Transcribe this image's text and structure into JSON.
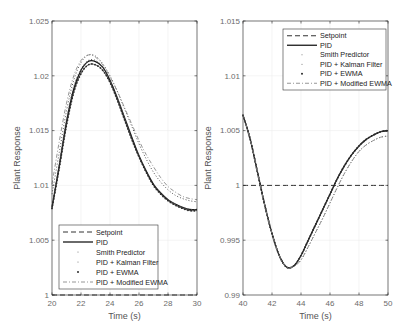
{
  "figure": {
    "background": "#ffffff",
    "axis_color": "#262626",
    "tick_label_color": "#6b6b6b",
    "grid_color": "#ececec"
  },
  "chart_data": [
    {
      "type": "line",
      "title": "",
      "xlabel": "Time (s)",
      "ylabel": "Plant Response",
      "xlim": [
        20,
        30
      ],
      "ylim": [
        1,
        1.025
      ],
      "xticks": [
        20,
        22,
        24,
        26,
        28,
        30
      ],
      "xtick_labels": [
        "20",
        "22",
        "24",
        "26",
        "28",
        "30"
      ],
      "yticks": [
        1,
        1.005,
        1.01,
        1.015,
        1.02,
        1.025
      ],
      "ytick_labels": [
        "1",
        "1.005",
        "1.01",
        "1.015",
        "1.02",
        "1.025"
      ],
      "grid": true,
      "legend_position": "lower left",
      "legend": [
        "Setpoint",
        "PID",
        "Smith Predictor",
        "PID + Kalman Filter",
        "PID + EWMA",
        "PID + Modified EWMA"
      ],
      "x": [
        20,
        20.5,
        21,
        21.5,
        22,
        22.5,
        23,
        23.5,
        24,
        24.5,
        25,
        25.5,
        26,
        26.5,
        27,
        27.5,
        28,
        28.5,
        29,
        29.5,
        30
      ],
      "series": [
        {
          "name": "Setpoint",
          "style": "dashed",
          "values": [
            1,
            1,
            1,
            1,
            1,
            1,
            1,
            1,
            1,
            1,
            1,
            1,
            1,
            1,
            1,
            1,
            1,
            1,
            1,
            1,
            1
          ]
        },
        {
          "name": "PID",
          "style": "solid",
          "values": [
            1.008,
            1.0118,
            1.0158,
            1.0188,
            1.0205,
            1.0213,
            1.0213,
            1.0208,
            1.0196,
            1.018,
            1.0162,
            1.0144,
            1.0127,
            1.0113,
            1.0101,
            1.0093,
            1.0087,
            1.0083,
            1.008,
            1.0078,
            1.0078
          ]
        },
        {
          "name": "Smith Predictor",
          "style": "dotted",
          "values": [
            1.008,
            1.012,
            1.016,
            1.019,
            1.0206,
            1.0214,
            1.0214,
            1.0208,
            1.0196,
            1.018,
            1.0162,
            1.0144,
            1.0127,
            1.0113,
            1.0101,
            1.0093,
            1.0087,
            1.0083,
            1.008,
            1.0078,
            1.0078
          ]
        },
        {
          "name": "PID + Kalman Filter",
          "style": "dotted",
          "values": [
            1.0092,
            1.013,
            1.0168,
            1.0196,
            1.0212,
            1.0219,
            1.0218,
            1.0211,
            1.02,
            1.0186,
            1.017,
            1.0154,
            1.0138,
            1.0124,
            1.0112,
            1.0103,
            1.0096,
            1.0091,
            1.0088,
            1.0086,
            1.0085
          ]
        },
        {
          "name": "PID + EWMA",
          "style": "marker",
          "values": [
            1.0079,
            1.0116,
            1.0155,
            1.0185,
            1.0202,
            1.021,
            1.021,
            1.0205,
            1.0194,
            1.0178,
            1.016,
            1.0142,
            1.0126,
            1.0112,
            1.01,
            1.0092,
            1.0086,
            1.0082,
            1.0079,
            1.0077,
            1.0077
          ]
        },
        {
          "name": "PID + Modified EWMA",
          "style": "dashdot",
          "values": [
            1.0101,
            1.014,
            1.0175,
            1.02,
            1.0214,
            1.0219,
            1.0217,
            1.021,
            1.0199,
            1.0186,
            1.0171,
            1.0156,
            1.0141,
            1.0128,
            1.0117,
            1.0107,
            1.0099,
            1.0094,
            1.009,
            1.0088,
            1.0087
          ]
        }
      ]
    },
    {
      "type": "line",
      "title": "",
      "xlabel": "Time (s)",
      "ylabel": "Plant Response",
      "xlim": [
        40,
        50
      ],
      "ylim": [
        0.99,
        1.015
      ],
      "xticks": [
        40,
        42,
        44,
        46,
        48,
        50
      ],
      "xtick_labels": [
        "40",
        "42",
        "44",
        "46",
        "48",
        "50"
      ],
      "yticks": [
        0.99,
        0.995,
        1,
        1.005,
        1.01,
        1.015
      ],
      "ytick_labels": [
        "0.99",
        "0.995",
        "1",
        "1.005",
        "1.01",
        "1.015"
      ],
      "grid": true,
      "legend_position": "upper right",
      "legend": [
        "Setpoint",
        "PID",
        "Smith Predictor",
        "PID + Kalman Filter",
        "PID + EWMA",
        "PID + Modified EWMA"
      ],
      "x": [
        40,
        40.5,
        41,
        41.5,
        42,
        42.5,
        43,
        43.5,
        44,
        44.5,
        45,
        45.5,
        46,
        46.5,
        47,
        47.5,
        48,
        48.5,
        49,
        49.5,
        50
      ],
      "series": [
        {
          "name": "Setpoint",
          "style": "dashed",
          "values": [
            1,
            1,
            1,
            1,
            1,
            1,
            1,
            1,
            1,
            1,
            1,
            1,
            1,
            1,
            1,
            1,
            1,
            1,
            1,
            1,
            1
          ]
        },
        {
          "name": "PID",
          "style": "solid",
          "values": [
            1.0064,
            1.0042,
            1.0012,
            0.9982,
            0.9956,
            0.9936,
            0.99255,
            0.99265,
            0.9936,
            0.995,
            0.9964,
            0.9978,
            0.9992,
            1.0006,
            1.0018,
            1.0028,
            1.0036,
            1.0042,
            1.0046,
            1.0049,
            1.005
          ]
        },
        {
          "name": "Smith Predictor",
          "style": "dotted",
          "values": [
            1.0064,
            1.0042,
            1.0012,
            0.9982,
            0.9956,
            0.9936,
            0.99255,
            0.99265,
            0.9936,
            0.995,
            0.9964,
            0.9978,
            0.9992,
            1.0006,
            1.0018,
            1.0028,
            1.0036,
            1.0042,
            1.0046,
            1.0049,
            1.005
          ]
        },
        {
          "name": "PID + Kalman Filter",
          "style": "dotted",
          "values": [
            1.0064,
            1.0042,
            1.0012,
            0.9982,
            0.9956,
            0.9936,
            0.99255,
            0.9926,
            0.9932,
            0.9944,
            0.9957,
            0.997,
            0.9984,
            0.9998,
            1.0011,
            1.0022,
            1.0031,
            1.0037,
            1.0041,
            1.0044,
            1.0045
          ]
        },
        {
          "name": "PID + EWMA",
          "style": "marker",
          "values": [
            1.0064,
            1.0042,
            1.0012,
            0.9982,
            0.9956,
            0.9936,
            0.99255,
            0.99265,
            0.9936,
            0.995,
            0.9964,
            0.9978,
            0.9992,
            1.0006,
            1.0018,
            1.0028,
            1.0036,
            1.0042,
            1.0046,
            1.0049,
            1.005
          ]
        },
        {
          "name": "PID + Modified EWMA",
          "style": "dashdot",
          "values": [
            1.0064,
            1.0042,
            1.0012,
            0.9982,
            0.9956,
            0.9936,
            0.99255,
            0.9926,
            0.9932,
            0.9944,
            0.9957,
            0.997,
            0.9984,
            0.9998,
            1.0011,
            1.0022,
            1.0031,
            1.0037,
            1.0041,
            1.0044,
            1.0045
          ]
        }
      ]
    }
  ],
  "layout": [
    {
      "x0": 52,
      "x1": 197,
      "y0": 21,
      "y1": 295,
      "legend": {
        "x": 59,
        "y": 225,
        "w": 99,
        "h": 64
      }
    },
    {
      "x0": 243,
      "x1": 388,
      "y0": 21,
      "y1": 295,
      "legend": {
        "x": 283,
        "y": 29,
        "w": 103,
        "h": 61
      }
    }
  ]
}
